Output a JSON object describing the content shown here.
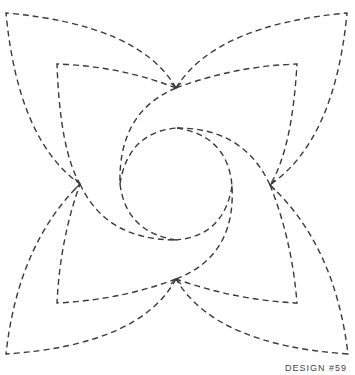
{
  "caption": "DESIGN #59",
  "stroke_color": "#3a3a3a",
  "background": "#ffffff"
}
